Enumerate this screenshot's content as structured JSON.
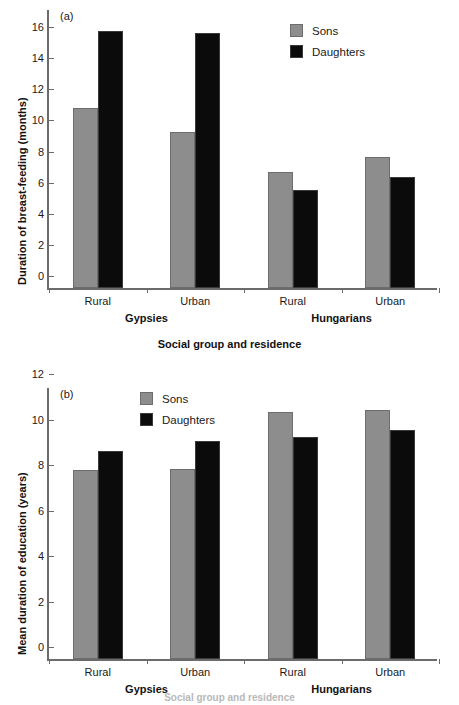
{
  "figure": {
    "background_color": "#ffffff",
    "series_colors": {
      "sons": "#8d8d8d",
      "daughters": "#0b0b0b"
    }
  },
  "panel_a": {
    "tag": "(a)",
    "ylabel": "Duration of breast-feeding (months)",
    "xlabel": "Social group and residence",
    "legend": {
      "sons": "Sons",
      "daughters": "Daughters"
    },
    "yticks": [
      "0",
      "2",
      "4",
      "6",
      "8",
      "10",
      "12",
      "14",
      "16",
      "18"
    ],
    "categories": [
      "Rural",
      "Urban",
      "Rural",
      "Urban"
    ],
    "groups": [
      "Gypsies",
      "Hungarians"
    ]
  },
  "panel_b": {
    "tag": "(b)",
    "ylabel": "Mean duration of education (years)",
    "xlabel": "Social group and residence",
    "legend": {
      "sons": "Sons",
      "daughters": "Daughters"
    },
    "yticks": [
      "0",
      "2",
      "4",
      "6",
      "8",
      "10",
      "12"
    ],
    "categories": [
      "Rural",
      "Urban",
      "Rural",
      "Urban"
    ],
    "groups": [
      "Gypsies",
      "Hungarians"
    ]
  },
  "chart_data": [
    {
      "type": "bar",
      "panel": "(a)",
      "title": "",
      "xlabel": "Social group and residence",
      "ylabel": "Duration of breast-feeding (months)",
      "categories": [
        "Gypsies Rural",
        "Gypsies Urban",
        "Hungarians Rural",
        "Hungarians Urban"
      ],
      "tick_labels": [
        "Rural",
        "Urban",
        "Rural",
        "Urban"
      ],
      "group_labels": [
        "Gypsies",
        "Hungarians"
      ],
      "series": [
        {
          "name": "Sons",
          "color": "#8d8d8d",
          "values": [
            11.6,
            10.0,
            7.45,
            8.45
          ]
        },
        {
          "name": "Daughters",
          "color": "#0b0b0b",
          "values": [
            16.55,
            16.4,
            6.3,
            7.15
          ]
        }
      ],
      "ylim": [
        0,
        18
      ],
      "ytick_values": [
        0,
        2,
        4,
        6,
        8,
        10,
        12,
        14,
        16,
        18
      ],
      "grid": false,
      "legend_position": "top-right"
    },
    {
      "type": "bar",
      "panel": "(b)",
      "title": "",
      "xlabel": "Social group and residence",
      "ylabel": "Mean duration of education (years)",
      "categories": [
        "Gypsies Rural",
        "Gypsies Urban",
        "Hungarians Rural",
        "Hungarians Urban"
      ],
      "tick_labels": [
        "Rural",
        "Urban",
        "Rural",
        "Urban"
      ],
      "group_labels": [
        "Gypsies",
        "Hungarians"
      ],
      "series": [
        {
          "name": "Sons",
          "color": "#8d8d8d",
          "values": [
            8.3,
            8.35,
            10.85,
            10.95
          ]
        },
        {
          "name": "Daughters",
          "color": "#0b0b0b",
          "values": [
            9.15,
            9.6,
            9.75,
            10.05
          ]
        }
      ],
      "ylim": [
        0,
        12
      ],
      "ytick_values": [
        0,
        2,
        4,
        6,
        8,
        10,
        12
      ],
      "grid": false,
      "legend_position": "top-left"
    }
  ]
}
